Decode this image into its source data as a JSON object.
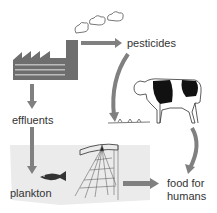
{
  "diagram": {
    "nodes": {
      "factory": {
        "label": "",
        "icon": "factory-icon"
      },
      "smoke": {
        "icon": "smoke-cloud-icon"
      },
      "pesticides": {
        "label": "pesticides"
      },
      "cow": {
        "icon": "cow-icon"
      },
      "effluents": {
        "label": "effluents"
      },
      "plankton": {
        "label": "plankton"
      },
      "fish": {
        "icon": "fish-icon"
      },
      "net": {
        "icon": "fishing-net-icon"
      },
      "food": {
        "label_line1": "food for",
        "label_line2": "humans"
      }
    },
    "edges": [
      {
        "from": "factory",
        "to": "pesticides"
      },
      {
        "from": "factory",
        "to": "effluents"
      },
      {
        "from": "effluents",
        "to": "plankton"
      },
      {
        "from": "pesticides",
        "to": "ground"
      },
      {
        "from": "cow",
        "to": "food"
      },
      {
        "from": "net",
        "to": "food"
      }
    ],
    "colors": {
      "arrow": "#808080",
      "factory": "#6e6e6e",
      "water": "#e8e8e8",
      "text": "#333333"
    }
  }
}
